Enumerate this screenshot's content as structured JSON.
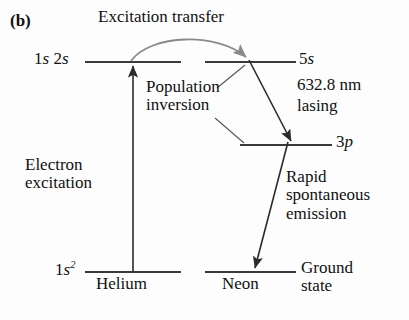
{
  "figure": {
    "panel_letter": "(b)",
    "caption_topic": "Helium-Neon laser energy level diagram"
  },
  "labels": {
    "excitation_transfer": "Excitation transfer",
    "population_inversion_line1": "Population",
    "population_inversion_line2": "inversion",
    "electron_excitation_line1": "Electron",
    "electron_excitation_line2": "excitation",
    "wavelength": "632.8 nm",
    "lasing": "lasing",
    "rapid_line1": "Rapid",
    "rapid_line2": "spontaneous",
    "rapid_line3": "emission",
    "helium": "Helium",
    "neon": "Neon",
    "ground_state_line1": "Ground",
    "ground_state_line2": "state"
  },
  "levels": {
    "helium_excited_prefix": "1",
    "helium_excited_s1": "s",
    "helium_excited_mid": " 2",
    "helium_excited_s2": "s",
    "helium_ground_prefix": "1",
    "helium_ground_s": "s",
    "helium_ground_sup": "2",
    "neon_5s_num": "5",
    "neon_5s_letter": "s",
    "neon_3p_num": "3",
    "neon_3p_letter": "p"
  },
  "colors": {
    "background": "#fdfdfd",
    "ink": "#111111",
    "level_line": "#3a3a3a",
    "arrow": "#2b2b2b",
    "curved_arrow": "#8a8a8a",
    "leader_line": "#555555"
  },
  "geometry": {
    "helium_excited_level_y": 62,
    "neon_5s_level_y": 62,
    "neon_3p_level_y": 145,
    "ground_level_y": 272,
    "helium_level_x1": 85,
    "helium_level_x2": 181,
    "neon_level_x1": 205,
    "neon_level_x2": 296,
    "neon_3p_x1": 240,
    "neon_3p_x2": 332,
    "electron_arrow_x": 133
  }
}
